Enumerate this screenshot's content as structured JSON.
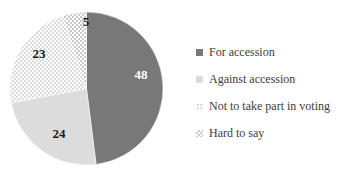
{
  "chart_data": {
    "type": "pie",
    "title": "",
    "total": 100,
    "start_angle_deg": 0,
    "direction": "clockwise",
    "legend_position": "right",
    "value_labels_shown": true,
    "slices": [
      {
        "label": "For accession",
        "value": 48,
        "pattern": "solid",
        "color": "#787878",
        "value_label_color": "#ffffff"
      },
      {
        "label": "Against accession",
        "value": 24,
        "pattern": "solid",
        "color": "#dcdcdc",
        "value_label_color": "#1a1a1a"
      },
      {
        "label": "Not to take part in voting",
        "value": 23,
        "pattern": "dots",
        "color": "#ffffff",
        "pattern_accent_color": "#cccccc",
        "value_label_color": "#1a1a1a"
      },
      {
        "label": "Hard to say",
        "value": 5,
        "pattern": "checker",
        "color": "#ffffff",
        "pattern_accent_color": "#c9c9c9",
        "value_label_color": "#1a1a1a"
      }
    ]
  }
}
